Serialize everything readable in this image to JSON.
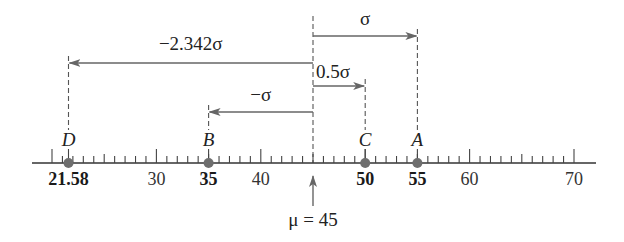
{
  "axis": {
    "min": 20,
    "max": 70,
    "x_start_px": 32,
    "x_end_px": 596,
    "value_to_px": {
      "v0": 20,
      "px0": 52,
      "v1": 70,
      "px1": 574
    },
    "y_px": 163,
    "major_ticks": [
      20,
      30,
      40,
      50,
      60,
      70
    ],
    "minor_step": 1,
    "tick_labels": [
      {
        "value": 21.58,
        "text": "21.58",
        "bold": true
      },
      {
        "value": 30,
        "text": "30",
        "bold": false
      },
      {
        "value": 35,
        "text": "35",
        "bold": true
      },
      {
        "value": 40,
        "text": "40",
        "bold": false
      },
      {
        "value": 50,
        "text": "50",
        "bold": true
      },
      {
        "value": 55,
        "text": "55",
        "bold": true
      },
      {
        "value": 60,
        "text": "60",
        "bold": false
      },
      {
        "value": 70,
        "text": "70",
        "bold": false
      }
    ]
  },
  "mean": {
    "value": 45,
    "label": "μ = 45"
  },
  "points": [
    {
      "name": "D",
      "value": 21.58
    },
    {
      "name": "B",
      "value": 35
    },
    {
      "name": "C",
      "value": 50
    },
    {
      "name": "A",
      "value": 55
    }
  ],
  "deviations": [
    {
      "label": "σ",
      "to": 55,
      "y_px": 36,
      "label_y_px": 25,
      "label_side": "center"
    },
    {
      "label": "−2.342σ",
      "to": 21.58,
      "y_px": 63,
      "label_y_px": 50,
      "label_side": "center"
    },
    {
      "label": "0.5σ",
      "to": 50,
      "y_px": 86,
      "label_y_px": 78,
      "label_side": "start"
    },
    {
      "label": "−σ",
      "to": 35,
      "y_px": 112,
      "label_y_px": 101,
      "label_side": "center"
    }
  ],
  "colors": {
    "arrow": "#666666",
    "dot": "#6e6e6e",
    "text": "#222222"
  }
}
